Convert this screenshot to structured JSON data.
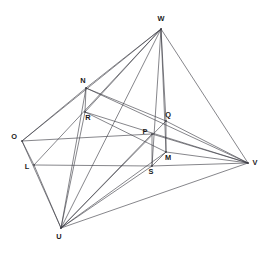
{
  "figure": {
    "type": "line-diagram",
    "width": 269,
    "height": 256,
    "background": "#ffffff",
    "line_color": "#3b3b42",
    "label_color": "#1a1a1a",
    "line_width": 0.62
  },
  "vertices": [
    {
      "id": "W",
      "label": "W",
      "x": 161,
      "y": 29,
      "label_x": 161,
      "label_y": 21,
      "anchor": "middle"
    },
    {
      "id": "N",
      "label": "N",
      "x": 86,
      "y": 88,
      "label_x": 83,
      "label_y": 83,
      "anchor": "middle"
    },
    {
      "id": "R",
      "label": "R",
      "x": 85,
      "y": 112,
      "label_x": 88,
      "label_y": 120,
      "anchor": "middle"
    },
    {
      "id": "O",
      "label": "O",
      "x": 22,
      "y": 141,
      "label_x": 14,
      "label_y": 139,
      "anchor": "middle"
    },
    {
      "id": "L",
      "label": "L",
      "x": 34,
      "y": 165,
      "label_x": 27,
      "label_y": 169,
      "anchor": "middle"
    },
    {
      "id": "Q",
      "label": "Q",
      "x": 166,
      "y": 121,
      "label_x": 168,
      "label_y": 117,
      "anchor": "middle"
    },
    {
      "id": "P",
      "label": "P",
      "x": 152,
      "y": 134,
      "label_x": 145,
      "label_y": 134,
      "anchor": "middle"
    },
    {
      "id": "M",
      "label": "M",
      "x": 166,
      "y": 152,
      "label_x": 168,
      "label_y": 160,
      "anchor": "middle"
    },
    {
      "id": "S",
      "label": "S",
      "x": 152,
      "y": 166,
      "label_x": 151,
      "label_y": 174,
      "anchor": "middle"
    },
    {
      "id": "V",
      "label": "V",
      "x": 248,
      "y": 163,
      "label_x": 255,
      "label_y": 165,
      "anchor": "middle"
    },
    {
      "id": "U",
      "label": "U",
      "x": 61,
      "y": 228,
      "label_x": 59,
      "label_y": 239,
      "anchor": "middle"
    }
  ],
  "edges": [
    {
      "from": "W",
      "to": "O"
    },
    {
      "from": "W",
      "to": "N"
    },
    {
      "from": "W",
      "to": "R"
    },
    {
      "from": "W",
      "to": "U"
    },
    {
      "from": "W",
      "to": "L"
    },
    {
      "from": "W",
      "to": "S"
    },
    {
      "from": "W",
      "to": "M"
    },
    {
      "from": "W",
      "to": "Q"
    },
    {
      "from": "W",
      "to": "V"
    },
    {
      "from": "O",
      "to": "N"
    },
    {
      "from": "O",
      "to": "L"
    },
    {
      "from": "O",
      "to": "U"
    },
    {
      "from": "O",
      "to": "P"
    },
    {
      "from": "P",
      "to": "V"
    },
    {
      "from": "L",
      "to": "S"
    },
    {
      "from": "S",
      "to": "M"
    },
    {
      "from": "M",
      "to": "V"
    },
    {
      "from": "L",
      "to": "U"
    },
    {
      "from": "N",
      "to": "R"
    },
    {
      "from": "N",
      "to": "Q"
    },
    {
      "from": "R",
      "to": "M"
    },
    {
      "from": "Q",
      "to": "M"
    },
    {
      "from": "P",
      "to": "S"
    },
    {
      "from": "N",
      "to": "V"
    },
    {
      "from": "R",
      "to": "V"
    },
    {
      "from": "Q",
      "to": "V"
    },
    {
      "from": "S",
      "to": "V"
    },
    {
      "from": "U",
      "to": "V"
    },
    {
      "from": "U",
      "to": "N"
    },
    {
      "from": "U",
      "to": "R"
    },
    {
      "from": "U",
      "to": "P"
    },
    {
      "from": "U",
      "to": "Q"
    },
    {
      "from": "U",
      "to": "M"
    },
    {
      "from": "U",
      "to": "S"
    }
  ]
}
